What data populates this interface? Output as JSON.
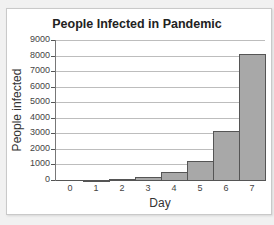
{
  "chart_data": {
    "type": "bar",
    "title": "People Infected in Pandemic",
    "xlabel": "Day",
    "ylabel": "People infected",
    "categories": [
      "0",
      "1",
      "2",
      "3",
      "4",
      "5",
      "6",
      "7"
    ],
    "values": [
      0,
      30,
      80,
      200,
      500,
      1250,
      3150,
      8100
    ],
    "ylim": [
      0,
      9000
    ],
    "yticks": [
      "0",
      "1000",
      "2000",
      "3000",
      "4000",
      "5000",
      "6000",
      "7000",
      "8000",
      "9000"
    ],
    "grid": true,
    "legend": "none",
    "bar_color": "#a8a8a8"
  }
}
